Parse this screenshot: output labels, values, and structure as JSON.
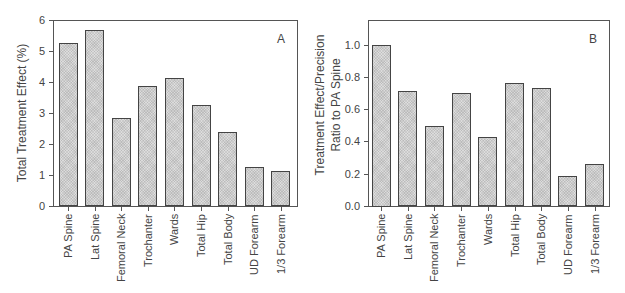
{
  "chart_data": [
    {
      "type": "bar",
      "panel": "A",
      "title": "",
      "xlabel": "",
      "ylabel": "Total Treatment Effect (%)",
      "ylim": [
        0,
        6
      ],
      "yticks": [
        0,
        1,
        2,
        3,
        4,
        5,
        6
      ],
      "grid": false,
      "categories": [
        "PA Spine",
        "Lat Spine",
        "Femoral Neck",
        "Trochanter",
        "Wards",
        "Total Hip",
        "Total Body",
        "UD Forearm",
        "1/3 Forearm"
      ],
      "values": [
        5.25,
        5.68,
        2.83,
        3.87,
        4.14,
        3.25,
        2.39,
        1.26,
        1.14
      ]
    },
    {
      "type": "bar",
      "panel": "B",
      "title": "",
      "xlabel": "",
      "ylabel": "Treatment Effect/Precision Ratio to PA Spine",
      "ylabel_lines": [
        "Treatment Effect/Precision",
        "Ratio to PA Spine"
      ],
      "ylim": [
        0,
        1.15
      ],
      "yticks": [
        "0.0",
        "0.2",
        "0.4",
        "0.6",
        "0.8",
        "1.0"
      ],
      "grid": false,
      "categories": [
        "PA Spine",
        "Lat Spine",
        "Femoral Neck",
        "Trochanter",
        "Wards",
        "Total Hip",
        "Total Body",
        "UD Forearm",
        "1/3 Forearm"
      ],
      "values": [
        1.0,
        0.715,
        0.495,
        0.7,
        0.43,
        0.76,
        0.73,
        0.185,
        0.26
      ]
    }
  ]
}
